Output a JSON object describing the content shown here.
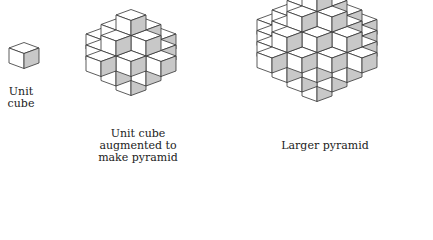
{
  "figures": [
    {
      "id": "unit-cube",
      "label": "Unit\ncube",
      "origin": [
        9,
        63
      ],
      "order": 0,
      "label_pos": [
        0,
        86,
        42
      ]
    },
    {
      "id": "small-pyramid",
      "label": "Unit cube\naugmented to\nmake pyramid",
      "origin": [
        116,
        30
      ],
      "order": 2,
      "label_pos": [
        88,
        128,
        100
      ]
    },
    {
      "id": "larger-pyramid",
      "label": "Larger pyramid",
      "origin": [
        302,
        6
      ],
      "order": 3,
      "label_pos": [
        270,
        140,
        110
      ]
    }
  ],
  "style": {
    "front_fill": "#ffffff",
    "top_fill": "#ffffff",
    "side_fill": "#c8c8c8",
    "stroke": "#333333",
    "cube": {
      "w": 15,
      "h": 15,
      "dx": 15,
      "dy": 5.5,
      "slope": 5.5
    }
  }
}
